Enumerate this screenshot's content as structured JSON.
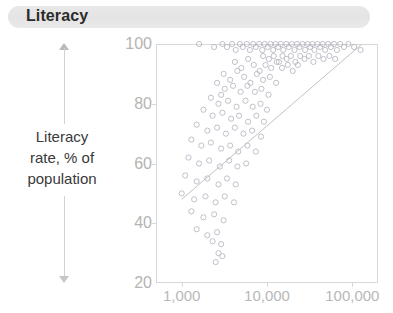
{
  "header": {
    "title": "Literacy"
  },
  "axis_label": {
    "line1": "Literacy",
    "line2": "rate, % of",
    "line3": "population"
  },
  "chart_data": {
    "type": "scatter",
    "title": "Literacy",
    "xlabel": "",
    "ylabel": "Literacy rate, % of population",
    "xscale": "log",
    "xlim": [
      500,
      200000
    ],
    "ylim": [
      20,
      100
    ],
    "xticks": [
      1000,
      10000,
      100000
    ],
    "xtick_labels": [
      "1,000",
      "10,000",
      "100,000"
    ],
    "yticks": [
      20,
      40,
      60,
      80,
      100
    ],
    "ytick_labels": [
      "20",
      "40",
      "60",
      "80",
      "100"
    ],
    "grid": false,
    "legend": false,
    "marker": "open-circle",
    "marker_color": "#b9b9c4",
    "frame_color": "#d8d8d8",
    "tick_label_color": "#b8b8b8",
    "title_band_color": "#e4e4e4",
    "title_text_color": "#2b2b2b",
    "trendline": {
      "type": "line",
      "color": "#c2c2c2",
      "x": [
        1000,
        130000
      ],
      "y": [
        48,
        100
      ]
    },
    "points": [
      {
        "x": 1600,
        "y": 100
      },
      {
        "x": 2400,
        "y": 99
      },
      {
        "x": 3000,
        "y": 100
      },
      {
        "x": 3400,
        "y": 99
      },
      {
        "x": 3900,
        "y": 100
      },
      {
        "x": 4300,
        "y": 98
      },
      {
        "x": 4800,
        "y": 100
      },
      {
        "x": 5200,
        "y": 99
      },
      {
        "x": 5800,
        "y": 100
      },
      {
        "x": 6300,
        "y": 98
      },
      {
        "x": 6900,
        "y": 100
      },
      {
        "x": 7400,
        "y": 99
      },
      {
        "x": 8100,
        "y": 100
      },
      {
        "x": 8800,
        "y": 98
      },
      {
        "x": 9400,
        "y": 100
      },
      {
        "x": 10200,
        "y": 99
      },
      {
        "x": 11000,
        "y": 100
      },
      {
        "x": 11800,
        "y": 98
      },
      {
        "x": 12600,
        "y": 100
      },
      {
        "x": 13500,
        "y": 99
      },
      {
        "x": 14500,
        "y": 100
      },
      {
        "x": 15500,
        "y": 98
      },
      {
        "x": 16800,
        "y": 100
      },
      {
        "x": 18000,
        "y": 99
      },
      {
        "x": 19500,
        "y": 100
      },
      {
        "x": 21000,
        "y": 98
      },
      {
        "x": 22500,
        "y": 100
      },
      {
        "x": 24000,
        "y": 99
      },
      {
        "x": 26000,
        "y": 100
      },
      {
        "x": 28000,
        "y": 98
      },
      {
        "x": 30000,
        "y": 100
      },
      {
        "x": 32000,
        "y": 99
      },
      {
        "x": 34000,
        "y": 100
      },
      {
        "x": 36000,
        "y": 98
      },
      {
        "x": 39000,
        "y": 100
      },
      {
        "x": 42000,
        "y": 99
      },
      {
        "x": 45000,
        "y": 100
      },
      {
        "x": 48000,
        "y": 98
      },
      {
        "x": 52000,
        "y": 100
      },
      {
        "x": 56000,
        "y": 99
      },
      {
        "x": 61000,
        "y": 100
      },
      {
        "x": 66000,
        "y": 98
      },
      {
        "x": 72000,
        "y": 100
      },
      {
        "x": 80000,
        "y": 99
      },
      {
        "x": 90000,
        "y": 100
      },
      {
        "x": 105000,
        "y": 99
      },
      {
        "x": 125000,
        "y": 98
      },
      {
        "x": 9000,
        "y": 96
      },
      {
        "x": 10500,
        "y": 95
      },
      {
        "x": 12000,
        "y": 96
      },
      {
        "x": 13800,
        "y": 94
      },
      {
        "x": 15200,
        "y": 96
      },
      {
        "x": 17000,
        "y": 95
      },
      {
        "x": 19000,
        "y": 96
      },
      {
        "x": 21500,
        "y": 94
      },
      {
        "x": 24500,
        "y": 96
      },
      {
        "x": 27500,
        "y": 95
      },
      {
        "x": 31000,
        "y": 96
      },
      {
        "x": 35000,
        "y": 94
      },
      {
        "x": 40000,
        "y": 96
      },
      {
        "x": 46000,
        "y": 95
      },
      {
        "x": 54000,
        "y": 96
      },
      {
        "x": 63000,
        "y": 95
      },
      {
        "x": 4200,
        "y": 94
      },
      {
        "x": 5000,
        "y": 92
      },
      {
        "x": 6000,
        "y": 95
      },
      {
        "x": 7000,
        "y": 93
      },
      {
        "x": 8200,
        "y": 91
      },
      {
        "x": 9600,
        "y": 93
      },
      {
        "x": 11200,
        "y": 92
      },
      {
        "x": 13000,
        "y": 94
      },
      {
        "x": 15000,
        "y": 92
      },
      {
        "x": 17500,
        "y": 93
      },
      {
        "x": 20000,
        "y": 91
      },
      {
        "x": 23000,
        "y": 93
      },
      {
        "x": 3100,
        "y": 90
      },
      {
        "x": 3700,
        "y": 88
      },
      {
        "x": 4500,
        "y": 91
      },
      {
        "x": 5400,
        "y": 89
      },
      {
        "x": 6400,
        "y": 87
      },
      {
        "x": 7600,
        "y": 90
      },
      {
        "x": 9000,
        "y": 88
      },
      {
        "x": 10800,
        "y": 89
      },
      {
        "x": 12800,
        "y": 87
      },
      {
        "x": 2600,
        "y": 87
      },
      {
        "x": 3200,
        "y": 85
      },
      {
        "x": 2900,
        "y": 83
      },
      {
        "x": 4000,
        "y": 86
      },
      {
        "x": 4900,
        "y": 84
      },
      {
        "x": 5900,
        "y": 86
      },
      {
        "x": 7200,
        "y": 84
      },
      {
        "x": 8600,
        "y": 85
      },
      {
        "x": 10400,
        "y": 83
      },
      {
        "x": 2200,
        "y": 82
      },
      {
        "x": 2700,
        "y": 80
      },
      {
        "x": 3500,
        "y": 81
      },
      {
        "x": 4400,
        "y": 79
      },
      {
        "x": 5600,
        "y": 81
      },
      {
        "x": 6800,
        "y": 79
      },
      {
        "x": 8400,
        "y": 80
      },
      {
        "x": 10000,
        "y": 78
      },
      {
        "x": 1800,
        "y": 78
      },
      {
        "x": 2300,
        "y": 76
      },
      {
        "x": 3000,
        "y": 77
      },
      {
        "x": 3800,
        "y": 75
      },
      {
        "x": 4700,
        "y": 76
      },
      {
        "x": 6000,
        "y": 74
      },
      {
        "x": 7500,
        "y": 76
      },
      {
        "x": 9200,
        "y": 74
      },
      {
        "x": 1500,
        "y": 73
      },
      {
        "x": 2000,
        "y": 71
      },
      {
        "x": 2600,
        "y": 72
      },
      {
        "x": 3300,
        "y": 70
      },
      {
        "x": 4200,
        "y": 72
      },
      {
        "x": 5300,
        "y": 70
      },
      {
        "x": 6700,
        "y": 71
      },
      {
        "x": 8500,
        "y": 69
      },
      {
        "x": 1300,
        "y": 68
      },
      {
        "x": 1700,
        "y": 66
      },
      {
        "x": 2200,
        "y": 67
      },
      {
        "x": 2900,
        "y": 65
      },
      {
        "x": 3700,
        "y": 66
      },
      {
        "x": 4600,
        "y": 64
      },
      {
        "x": 5900,
        "y": 66
      },
      {
        "x": 7400,
        "y": 64
      },
      {
        "x": 1200,
        "y": 62
      },
      {
        "x": 1600,
        "y": 60
      },
      {
        "x": 2100,
        "y": 61
      },
      {
        "x": 2800,
        "y": 59
      },
      {
        "x": 3600,
        "y": 61
      },
      {
        "x": 4500,
        "y": 59
      },
      {
        "x": 5700,
        "y": 60
      },
      {
        "x": 1100,
        "y": 56
      },
      {
        "x": 1500,
        "y": 54
      },
      {
        "x": 2000,
        "y": 55
      },
      {
        "x": 2700,
        "y": 53
      },
      {
        "x": 3400,
        "y": 55
      },
      {
        "x": 4300,
        "y": 53
      },
      {
        "x": 1000,
        "y": 50
      },
      {
        "x": 1400,
        "y": 48
      },
      {
        "x": 1900,
        "y": 49
      },
      {
        "x": 2500,
        "y": 47
      },
      {
        "x": 3200,
        "y": 49
      },
      {
        "x": 4100,
        "y": 47
      },
      {
        "x": 1300,
        "y": 44
      },
      {
        "x": 1800,
        "y": 42
      },
      {
        "x": 2400,
        "y": 43
      },
      {
        "x": 3100,
        "y": 41
      },
      {
        "x": 1500,
        "y": 38
      },
      {
        "x": 2000,
        "y": 36
      },
      {
        "x": 2600,
        "y": 37
      },
      {
        "x": 2300,
        "y": 34
      },
      {
        "x": 2900,
        "y": 33
      },
      {
        "x": 2700,
        "y": 30
      },
      {
        "x": 3000,
        "y": 29
      },
      {
        "x": 2500,
        "y": 27
      }
    ]
  }
}
